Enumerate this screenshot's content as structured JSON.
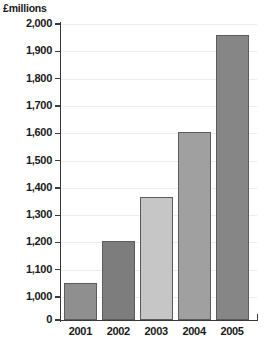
{
  "chart_data": {
    "type": "bar",
    "title": "",
    "subtitle": "",
    "xlabel": "",
    "ylabel": "£millions",
    "categories": [
      "2001",
      "2002",
      "2003",
      "2004",
      "2005"
    ],
    "values": [
      1050,
      1205,
      1365,
      1605,
      1960
    ],
    "series": [
      {
        "name": "£millions",
        "values": [
          1050,
          1205,
          1365,
          1605,
          1960
        ]
      }
    ],
    "bar_colors": [
      "#8f8f8f",
      "#7d7d7d",
      "#c6c6c6",
      "#a0a0a0",
      "#868686"
    ],
    "bar_border_color": "#5c5c5c",
    "ylim": [
      1000,
      2000
    ],
    "y_axis_broken": true,
    "y_tick_labels": [
      "2,000",
      "1,900",
      "1,800",
      "1,700",
      "1,600",
      "1,500",
      "1,400",
      "1,300",
      "1,200",
      "1,100",
      "1,000",
      "0"
    ],
    "y_tick_values": [
      2000,
      1900,
      1800,
      1700,
      1600,
      1500,
      1400,
      1300,
      1200,
      1100,
      1000,
      0
    ],
    "grid": true,
    "gridline_color": "#ededed",
    "legend": false,
    "legend_position": "none",
    "axis_color": "#3a3a3a",
    "background_color": "#ffffff"
  }
}
